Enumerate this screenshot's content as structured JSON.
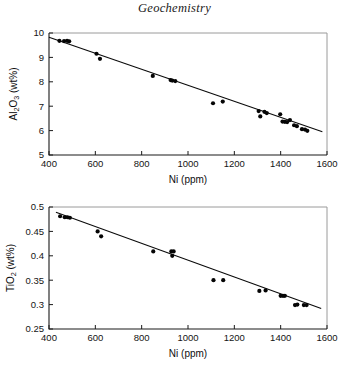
{
  "page": {
    "title": "Geochemistry",
    "background_color": "#ffffff",
    "point_color": "#050505",
    "line_color": "#0a0a0a",
    "frame_color": "#9a9a9a"
  },
  "chart_data": [
    {
      "id": "al2o3-vs-ni",
      "type": "scatter",
      "title": "",
      "xlabel": "Ni (ppm)",
      "ylabel": "Al2O3 (wt%)",
      "ylabel_parts": {
        "pre": "Al",
        "sub1": "2",
        "mid": "O",
        "sub2": "3",
        "post": " (wt%)"
      },
      "xlim": [
        400,
        1600
      ],
      "ylim": [
        5,
        10
      ],
      "xticks": [
        400,
        600,
        800,
        1000,
        1200,
        1400,
        1600
      ],
      "yticks": [
        5,
        6,
        7,
        8,
        9,
        10
      ],
      "xtick_labels": [
        "400",
        "600",
        "800",
        "1000",
        "1200",
        "1400",
        "1600"
      ],
      "ytick_labels": [
        "5",
        "6",
        "7",
        "8",
        "9",
        "10"
      ],
      "grid": false,
      "legend": "none",
      "trendline": {
        "x": [
          400,
          1580
        ],
        "y": [
          9.83,
          5.95
        ]
      },
      "x": [
        445,
        465,
        478,
        487,
        605,
        620,
        848,
        925,
        932,
        945,
        1108,
        1150,
        1305,
        1312,
        1330,
        1340,
        1398,
        1408,
        1418,
        1428,
        1440,
        1458,
        1470,
        1492,
        1505,
        1515
      ],
      "y": [
        9.68,
        9.67,
        9.68,
        9.66,
        9.15,
        8.94,
        8.24,
        8.07,
        8.05,
        8.03,
        7.12,
        7.19,
        6.8,
        6.58,
        6.77,
        6.72,
        6.67,
        6.37,
        6.36,
        6.35,
        6.43,
        6.22,
        6.18,
        6.06,
        6.04,
        5.99
      ]
    },
    {
      "id": "tio2-vs-ni",
      "type": "scatter",
      "title": "",
      "xlabel": "Ni (ppm)",
      "ylabel": "TiO2 (wt%)",
      "ylabel_parts": {
        "pre": "TiO",
        "sub1": "2",
        "mid": "",
        "sub2": "",
        "post": " (wt%)"
      },
      "xlim": [
        400,
        1600
      ],
      "ylim": [
        0.25,
        0.5
      ],
      "xticks": [
        400,
        600,
        800,
        1000,
        1200,
        1400,
        1600
      ],
      "yticks": [
        0.25,
        0.3,
        0.35,
        0.4,
        0.45,
        0.5
      ],
      "xtick_labels": [
        "400",
        "600",
        "800",
        "1000",
        "1200",
        "1400",
        "1600"
      ],
      "ytick_labels": [
        "0.25",
        "0.3",
        "0.35",
        "0.4",
        "0.45",
        "0.5"
      ],
      "grid": false,
      "legend": "none",
      "trendline": {
        "x": [
          430,
          1575
        ],
        "y": [
          0.489,
          0.292
        ]
      },
      "x": [
        448,
        468,
        480,
        490,
        610,
        625,
        850,
        928,
        938,
        932,
        1110,
        1152,
        1308,
        1335,
        1400,
        1410,
        1418,
        1462,
        1472,
        1500,
        1512
      ],
      "y": [
        0.481,
        0.479,
        0.479,
        0.478,
        0.45,
        0.44,
        0.409,
        0.409,
        0.409,
        0.4,
        0.35,
        0.35,
        0.328,
        0.329,
        0.318,
        0.318,
        0.318,
        0.299,
        0.3,
        0.299,
        0.299
      ]
    }
  ]
}
